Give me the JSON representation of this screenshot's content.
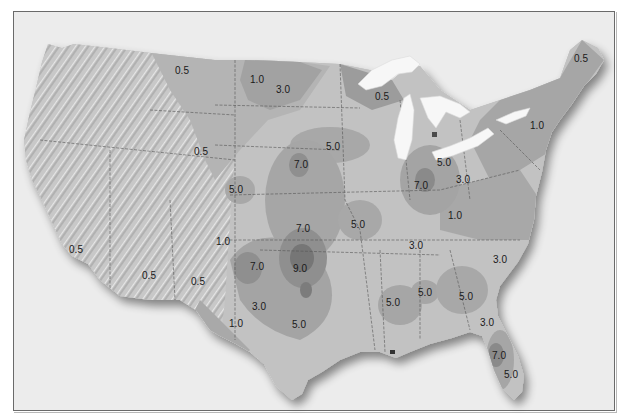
{
  "map": {
    "type": "contour-map",
    "region": "Contiguous United States",
    "colors": {
      "frame_border": "#6a6a6a",
      "frame_background": "#ececec",
      "relief_west": "#c9c9c9",
      "zone_0_5": "#b4b4b4",
      "zone_1_0": "#a9a9a9",
      "zone_3_0": "#c2c2c2",
      "zone_5_0": "#a6a6a6",
      "zone_7_0": "#8f8f8f",
      "zone_9_0": "#767676",
      "lakes": "#f7f7f7",
      "state_lines": "#555555",
      "label_text": "#1a1a1a"
    },
    "labels": [
      {
        "text": "0.5",
        "x": 182,
        "y": 70
      },
      {
        "text": "1.0",
        "x": 257,
        "y": 79
      },
      {
        "text": "3.0",
        "x": 283,
        "y": 89
      },
      {
        "text": "0.5",
        "x": 201,
        "y": 151
      },
      {
        "text": "7.0",
        "x": 301,
        "y": 164
      },
      {
        "text": "5.0",
        "x": 333,
        "y": 146
      },
      {
        "text": "5.0",
        "x": 236,
        "y": 189
      },
      {
        "text": "0.5",
        "x": 382,
        "y": 96
      },
      {
        "text": "0.5",
        "x": 581,
        "y": 58
      },
      {
        "text": "1.0",
        "x": 537,
        "y": 125
      },
      {
        "text": "5.0",
        "x": 444,
        "y": 162
      },
      {
        "text": "7.0",
        "x": 421,
        "y": 185
      },
      {
        "text": "3.0",
        "x": 463,
        "y": 179
      },
      {
        "text": "1.0",
        "x": 455,
        "y": 215
      },
      {
        "text": "5.0",
        "x": 358,
        "y": 224
      },
      {
        "text": "7.0",
        "x": 303,
        "y": 228
      },
      {
        "text": "1.0",
        "x": 223,
        "y": 241
      },
      {
        "text": "3.0",
        "x": 416,
        "y": 245
      },
      {
        "text": "3.0",
        "x": 500,
        "y": 259
      },
      {
        "text": "0.5",
        "x": 76,
        "y": 249
      },
      {
        "text": "0.5",
        "x": 149,
        "y": 275
      },
      {
        "text": "0.5",
        "x": 198,
        "y": 281
      },
      {
        "text": "7.0",
        "x": 257,
        "y": 266
      },
      {
        "text": "9.0",
        "x": 300,
        "y": 268
      },
      {
        "text": "3.0",
        "x": 259,
        "y": 306
      },
      {
        "text": "1.0",
        "x": 236,
        "y": 323
      },
      {
        "text": "5.0",
        "x": 299,
        "y": 324
      },
      {
        "text": "5.0",
        "x": 393,
        "y": 302
      },
      {
        "text": "5.0",
        "x": 425,
        "y": 292
      },
      {
        "text": "5.0",
        "x": 466,
        "y": 296
      },
      {
        "text": "3.0",
        "x": 487,
        "y": 322
      },
      {
        "text": "7.0",
        "x": 499,
        "y": 355
      },
      {
        "text": "5.0",
        "x": 511,
        "y": 374
      }
    ]
  }
}
